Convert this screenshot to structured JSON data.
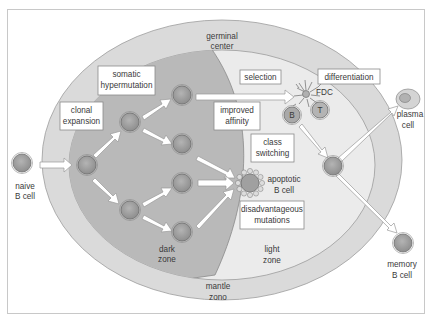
{
  "diagram": {
    "regions": {
      "mantle_zone": {
        "label_line1": "mantle",
        "label_line2": "zono",
        "color": "#dadada"
      },
      "germinal_center": {
        "label_line1": "germinal",
        "label_line2": "center",
        "color": "#d2d2d2"
      },
      "dark_zone": {
        "label_line1": "dark",
        "label_line2": "zone",
        "color": "#b9b9b9"
      },
      "light_zone": {
        "label_line1": "light",
        "label_line2": "zone",
        "color": "#ebebeb"
      }
    },
    "process_boxes": {
      "clonal_expansion": {
        "line1": "clonal",
        "line2": "expansion"
      },
      "somatic_hypermutation": {
        "line1": "somatic",
        "line2": "hypermutation"
      },
      "selection": {
        "line1": "selection"
      },
      "differentiation": {
        "line1": "differentiation"
      },
      "improved_affinity": {
        "line1": "improved",
        "line2": "affinity"
      },
      "class_switching": {
        "line1": "class",
        "line2": "switching"
      },
      "disadvantageous_mutations": {
        "line1": "disadvantageous",
        "line2": "mutations"
      }
    },
    "cell_labels": {
      "naive_b_cell": {
        "line1": "naive",
        "line2": "B cell"
      },
      "plasma_cell": {
        "line1": "plasma",
        "line2": "cell"
      },
      "memory_b_cell": {
        "line1": "memory",
        "line2": "B cell"
      },
      "apoptotic_b_cell": {
        "line1": "apoptotic",
        "line2": "B cell"
      },
      "fdc": "FDC",
      "b_marker": "B",
      "t_marker": "T"
    },
    "colors": {
      "cell_fill": "#a9a9a9",
      "cell_ring": "#6f6f6f",
      "arrow_fill": "#ffffff",
      "arrow_stroke": "#9a9a9a",
      "text": "#3a3a3a",
      "frame": "#c8c8c8"
    }
  }
}
